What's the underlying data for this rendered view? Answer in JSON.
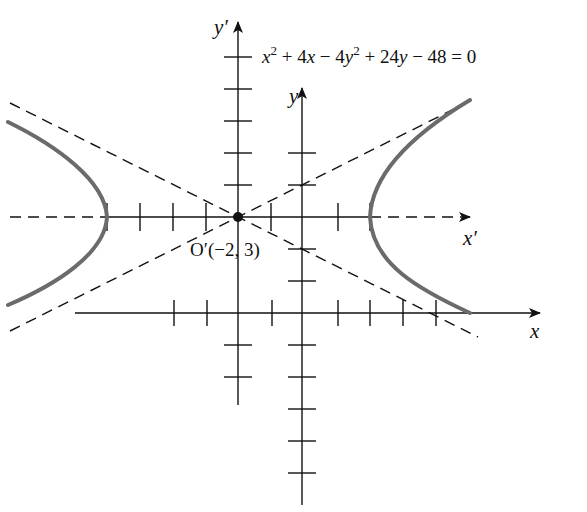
{
  "figure": {
    "equation": {
      "part1": "x",
      "sup1": "2",
      "part2": " + 4",
      "part3": "x",
      "part4": " − 4",
      "part5": "y",
      "sup2": "2",
      "part6": " + 24",
      "part7": "y",
      "part8": " − 48 = 0"
    },
    "labels": {
      "y_prime": "y′",
      "x_prime": "x′",
      "y": "y",
      "x": "x",
      "origin_prime": "O′(−2, 3)"
    },
    "colors": {
      "axes": "#111111",
      "curve": "#6b6b6b",
      "background": "#ffffff"
    },
    "geometry": {
      "center": [
        -2,
        3
      ],
      "a": 4,
      "b": 2,
      "asymptote_slopes": [
        0.5,
        -0.5
      ],
      "standard_form": "x'^2/16 - y'^2/4 = 1"
    }
  }
}
